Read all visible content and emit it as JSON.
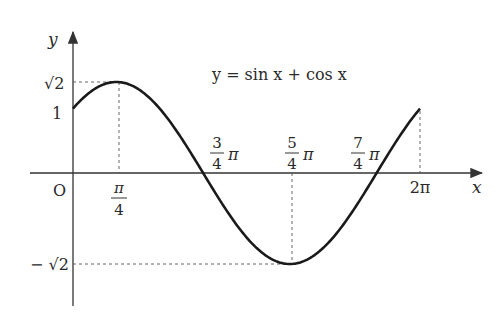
{
  "chart_data": {
    "type": "line",
    "title": "y = sin x + cos x",
    "xlabel": "x",
    "ylabel": "y",
    "origin_label": "O",
    "function": "sin(x) + cos(x)",
    "x_range": [
      0,
      6.2832
    ],
    "ylim": [
      -1.4142,
      1.4142
    ],
    "x_ticks": [
      {
        "value": 0.7854,
        "label": "π/4",
        "num": "π",
        "den": "4",
        "suffix": ""
      },
      {
        "value": 2.3562,
        "label": "3/4 π",
        "num": "3",
        "den": "4",
        "suffix": "π"
      },
      {
        "value": 3.927,
        "label": "5/4 π",
        "num": "5",
        "den": "4",
        "suffix": "π"
      },
      {
        "value": 5.4978,
        "label": "7/4 π",
        "num": "7",
        "den": "4",
        "suffix": "π"
      },
      {
        "value": 6.2832,
        "label": "2π"
      }
    ],
    "y_ticks": [
      {
        "value": 1.4142,
        "label": "√2"
      },
      {
        "value": 1,
        "label": "1"
      },
      {
        "value": -1.4142,
        "label": "−√2"
      }
    ],
    "key_points": [
      {
        "x": 0,
        "y": 1
      },
      {
        "x": 0.7854,
        "y": 1.4142,
        "note": "maximum"
      },
      {
        "x": 2.3562,
        "y": 0
      },
      {
        "x": 3.927,
        "y": -1.4142,
        "note": "minimum"
      },
      {
        "x": 5.4978,
        "y": 0
      },
      {
        "x": 6.2832,
        "y": 1
      }
    ],
    "grid": false,
    "dashed_guides": true,
    "colors": {
      "curve": "#1a1a1a",
      "axis": "#333333",
      "guide": "#555555"
    }
  },
  "labels": {
    "equation": "y = sin x + cos x",
    "x_axis": "x",
    "y_axis": "y",
    "origin": "O",
    "y_sqrt2": "√2",
    "y_one": "1",
    "y_neg_sqrt2": "− √2",
    "x_pi4_num": "π",
    "x_pi4_den": "4",
    "x_3pi4_num": "3",
    "x_3pi4_den": "4",
    "x_5pi4_num": "5",
    "x_5pi4_den": "4",
    "x_7pi4_num": "7",
    "x_7pi4_den": "4",
    "pi": "π",
    "x_2pi": "2π"
  }
}
